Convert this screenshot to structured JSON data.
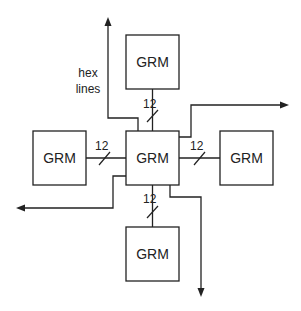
{
  "diagram": {
    "modules": {
      "center": {
        "label": "GRM"
      },
      "top": {
        "label": "GRM"
      },
      "left": {
        "label": "GRM"
      },
      "right": {
        "label": "GRM"
      },
      "bottom": {
        "label": "GRM"
      }
    },
    "bus_widths": {
      "top": "12",
      "left": "12",
      "right": "12",
      "bottom": "12"
    },
    "annotation": {
      "line1": "hex",
      "line2": "lines"
    },
    "colors": {
      "stroke": "#222222",
      "background": "#ffffff"
    }
  }
}
